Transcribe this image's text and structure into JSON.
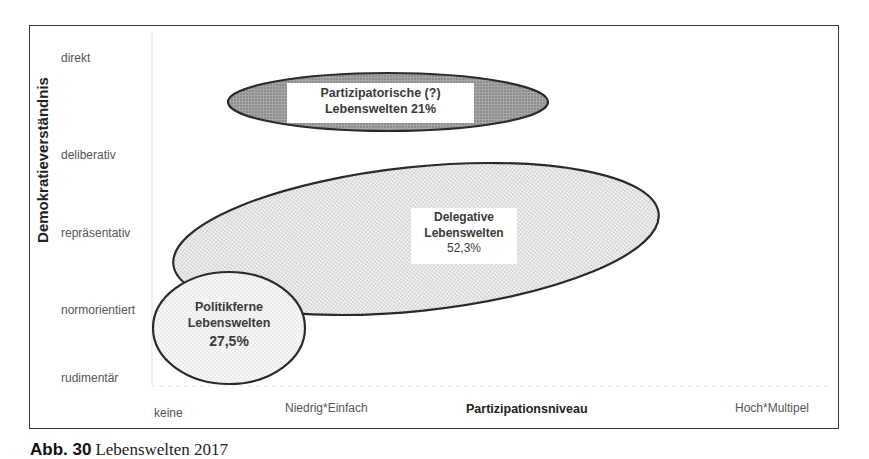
{
  "figure": {
    "y_axis_title": "Demokratieverständnis",
    "x_axis_title": "Partizipationsniveau",
    "y_ticks": [
      "direkt",
      "deliberativ",
      "repräsentativ",
      "normorientiert",
      "rudimentär"
    ],
    "x_ticks": [
      "keine",
      "Niedrig*Einfach",
      "Hoch*Multipel"
    ],
    "groups": [
      {
        "name": "participatory",
        "line1": "Partizipatorische (?)",
        "line2": "Lebenswelten 21%",
        "share": "21%",
        "fill": "#8c8c8c"
      },
      {
        "name": "delegative",
        "line1": "Delegative",
        "line2": "Lebenswelten",
        "line3": "52,3%",
        "share": "52,3%",
        "fill": "#d9d9d9"
      },
      {
        "name": "politikferne",
        "line1": "Politikferne",
        "line2": "Lebenswelten",
        "line3": "27,5%",
        "share": "27,5%",
        "fill": "#ececec"
      }
    ]
  },
  "caption": {
    "number": "Abb. 30",
    "text": "Lebenswelten 2017"
  }
}
